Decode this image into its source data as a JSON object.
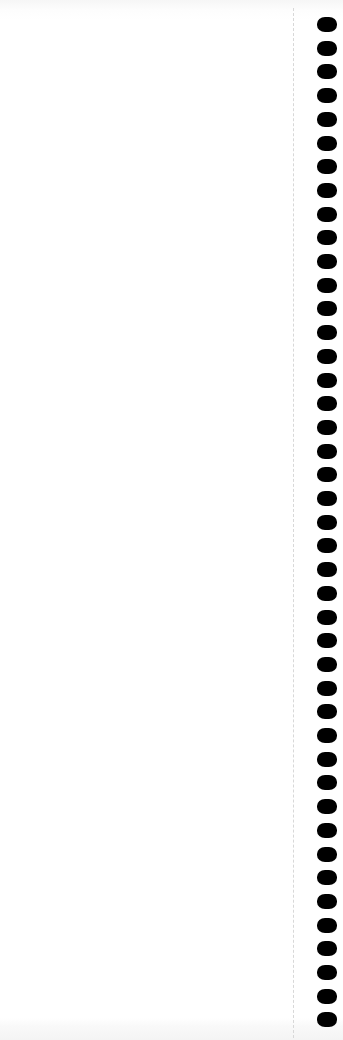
{
  "page": {
    "type": "blank-notebook-page",
    "background_color": "#ffffff",
    "edge_shade_color": "#f4f4f4",
    "perforation_color": "#d8d8d8"
  },
  "binding": {
    "hole_count": 43,
    "hole_color": "#000000",
    "first_hole_top": 17,
    "hole_spacing": 23.7,
    "hole_width": 20,
    "hole_height": 15
  }
}
